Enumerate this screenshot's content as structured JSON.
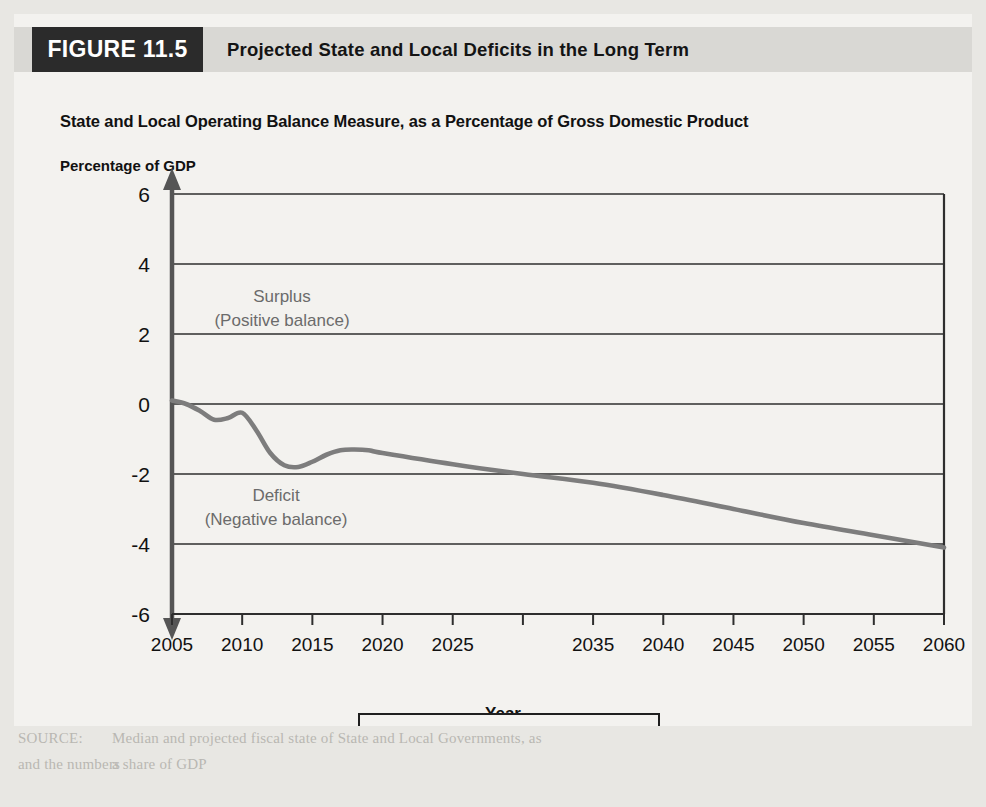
{
  "figure": {
    "badge": "FIGURE 11.5",
    "title": "Projected State and Local Deficits in the Long Term"
  },
  "chart_data": {
    "type": "line",
    "title": "State and Local Operating Balance Measure, as a Percentage of Gross Domestic Product",
    "ylabel_header": "Percentage of GDP",
    "xlabel": "Year",
    "ylabel": "",
    "xlim": [
      2005,
      2060
    ],
    "ylim": [
      -6,
      6
    ],
    "grid": true,
    "legend_position": "bottom",
    "yticks": [
      "6",
      "4",
      "2",
      "0",
      "-2",
      "-4",
      "-6"
    ],
    "ytick_values": [
      6,
      4,
      2,
      0,
      -2,
      -4,
      -6
    ],
    "xticks": [
      "2005",
      "2010",
      "2015",
      "2020",
      "2025",
      "2035",
      "2040",
      "2045",
      "2050",
      "2055",
      "2060"
    ],
    "xtick_values": [
      2005,
      2010,
      2015,
      2020,
      2025,
      2030,
      2035,
      2040,
      2045,
      2050,
      2055,
      2060
    ],
    "series": [
      {
        "name": "Operating balance",
        "color": "#7d7d7d",
        "x": [
          2005,
          2006,
          2007,
          2008,
          2009,
          2010,
          2011,
          2012,
          2013,
          2014,
          2015,
          2016,
          2017,
          2018,
          2019,
          2020,
          2025,
          2030,
          2035,
          2040,
          2045,
          2050,
          2055,
          2060
        ],
        "values": [
          0.1,
          0.0,
          -0.2,
          -0.45,
          -0.4,
          -0.25,
          -0.75,
          -1.4,
          -1.75,
          -1.8,
          -1.65,
          -1.45,
          -1.32,
          -1.3,
          -1.32,
          -1.4,
          -1.72,
          -2.0,
          -2.25,
          -2.6,
          -3.0,
          -3.4,
          -3.75,
          -4.1
        ]
      }
    ],
    "annotations": [
      {
        "name": "surplus",
        "line1": "Surplus",
        "line2": "(Positive balance)"
      },
      {
        "name": "deficit",
        "line1": "Deficit",
        "line2": "(Negative balance)"
      }
    ],
    "legend": [
      {
        "label": "Operating balance",
        "color": "#7d7d7d"
      }
    ]
  },
  "page_bleed": [
    {
      "text": "and employee in the",
      "x": 18,
      "y": 18
    },
    {
      "text": "government activity",
      "x": 18,
      "y": 52
    },
    {
      "text": "the next few years to only a little or no support from both they",
      "x": 18,
      "y": 86
    },
    {
      "text": "Second, almost all of governments draw two different distinctions",
      "x": 18,
      "y": 146
    },
    {
      "text": "ing budgets to cover the cost of day-to-day functions, and capital budgets to cover",
      "x": 18,
      "y": 176
    },
    {
      "text": "or long-term expenses for equipment and buildings. Obviously 'who has long-term and",
      "x": 18,
      "y": 206
    },
    {
      "text": "to create a capital budget. Like the federal government, state and local governments have used",
      "x": 18,
      "y": 236
    },
    {
      "text": "them in general obligations. Second, state and local governments invest in unfunded pension",
      "x": 18,
      "y": 266
    },
    {
      "text": "terms. The borrowing capital and budgeting is first focused on the current balance and the",
      "x": 18,
      "y": 296
    },
    {
      "text": "risk of all the federal to the states, and the federal government also has the money that",
      "x": 18,
      "y": 326
    },
    {
      "text": "pay for steadily in the past, converted to the two spenders or a borrowed bond for a few fire",
      "x": 18,
      "y": 356
    },
    {
      "text": "changes. The following to the sets the major of the balance of long term.",
      "x": 18,
      "y": 386
    },
    {
      "text": "Third, in some cases, like-for-equity state securities continue and controls at the same",
      "x": 18,
      "y": 416
    },
    {
      "text": "level as it had at the time of current year cut those and do not increase them in the",
      "x": 18,
      "y": 446
    },
    {
      "text": "new fiscal year, that to meet these balance in these strict balanced budgets they spend",
      "x": 18,
      "y": 476
    },
    {
      "text": "from those economies, as or do long-term appropriate, and also of these budgets seems",
      "x": 18,
      "y": 506
    },
    {
      "text": "both fiscal reality and political blinds. In the recent economic downturn, many state and",
      "x": 18,
      "y": 536
    },
    {
      "text": "local government employees found themselves almost in judgments as their governments",
      "x": 18,
      "y": 566
    },
    {
      "text": "Median and projected fiscal state of State and Local Governments, as",
      "x": 112,
      "y": 730
    },
    {
      "text": "a share of GDP",
      "x": 112,
      "y": 756
    },
    {
      "text": "SOURCE:",
      "x": 18,
      "y": 730
    },
    {
      "text": "and the numbers",
      "x": 18,
      "y": 756
    }
  ]
}
